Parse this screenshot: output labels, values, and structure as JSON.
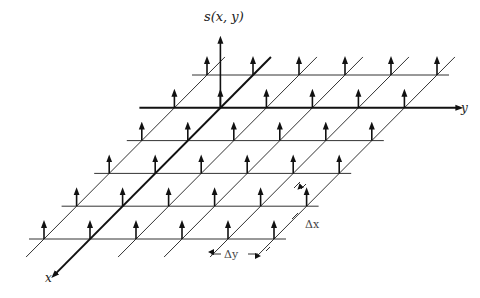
{
  "figure": {
    "type": "sampling-grid-diagram",
    "labels": {
      "vertical_axis": "s(x, y)",
      "horizontal_axis": "y",
      "depth_axis": "x",
      "spacing_x": "Δx",
      "spacing_y": "Δy"
    },
    "grid": {
      "rows": 6,
      "columns": 6,
      "origin_row": 1,
      "origin_column": 1,
      "first_row_y": 75,
      "row_spacing": 32.8,
      "row_shift_x": -32.6,
      "first_column_x": 207,
      "column_spacing": 46
    },
    "colors": {
      "line": "#333333",
      "axis": "#111111",
      "text": "#222222"
    }
  }
}
